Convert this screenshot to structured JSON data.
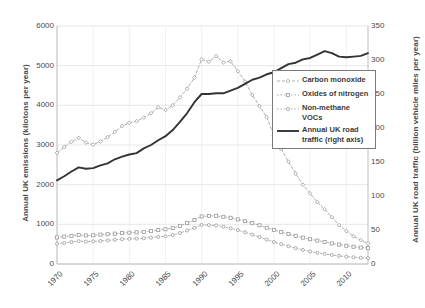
{
  "chart_data": {
    "type": "line",
    "title": "",
    "subtitle": "",
    "xlabel": "",
    "ylabel": "Annual UK emissions (kilotons per year)",
    "ylabel_right": "Annual UK road traffic (billion vehicle miles per year)",
    "grid": true,
    "legend_position": "center-right",
    "xlim": [
      1970,
      2013
    ],
    "ylim": [
      0,
      6000
    ],
    "ylim_right": [
      0,
      350
    ],
    "xticks": [
      "1970",
      "1975",
      "1980",
      "1985",
      "1990",
      "1995",
      "2000",
      "2005",
      "2010"
    ],
    "xtick_values": [
      1970,
      1975,
      1980,
      1985,
      1990,
      1995,
      2000,
      2005,
      2010
    ],
    "yticks_left": [
      "0",
      "1000",
      "2000",
      "3000",
      "4000",
      "5000",
      "6000"
    ],
    "ytick_values_left": [
      0,
      1000,
      2000,
      3000,
      4000,
      5000,
      6000
    ],
    "yticks_right": [
      "0",
      "50",
      "100",
      "150",
      "200",
      "250",
      "300",
      "350"
    ],
    "ytick_values_right": [
      0,
      50,
      100,
      150,
      200,
      250,
      300,
      350
    ],
    "x": [
      1970,
      1971,
      1972,
      1973,
      1974,
      1975,
      1976,
      1977,
      1978,
      1979,
      1980,
      1981,
      1982,
      1983,
      1984,
      1985,
      1986,
      1987,
      1988,
      1989,
      1990,
      1991,
      1992,
      1993,
      1994,
      1995,
      1996,
      1997,
      1998,
      1999,
      2000,
      2001,
      2002,
      2003,
      2004,
      2005,
      2006,
      2007,
      2008,
      2009,
      2010,
      2011,
      2012,
      2013
    ],
    "series": [
      {
        "name": "Carbon monoxide",
        "axis": "left",
        "color": "#9a9a9a",
        "style": "dashed-markers",
        "marker": "diamond",
        "values": [
          2800,
          2950,
          3080,
          3180,
          3060,
          3010,
          3090,
          3200,
          3330,
          3480,
          3560,
          3600,
          3690,
          3800,
          3950,
          3880,
          4000,
          4200,
          4420,
          4700,
          5160,
          5100,
          5240,
          5080,
          5110,
          4860,
          4600,
          4260,
          3980,
          3700,
          3240,
          2900,
          2580,
          2280,
          2000,
          1780,
          1560,
          1380,
          1180,
          980,
          830,
          700,
          600,
          520
        ]
      },
      {
        "name": "Oxides of nitrogen",
        "axis": "left",
        "color": "#9a9a9a",
        "style": "dotted-markers",
        "marker": "square",
        "values": [
          670,
          690,
          710,
          730,
          720,
          725,
          740,
          750,
          765,
          780,
          790,
          800,
          810,
          830,
          855,
          875,
          905,
          960,
          1030,
          1110,
          1200,
          1210,
          1215,
          1190,
          1165,
          1125,
          1080,
          1030,
          975,
          915,
          860,
          805,
          755,
          710,
          665,
          625,
          590,
          555,
          520,
          490,
          460,
          435,
          415,
          400
        ]
      },
      {
        "name": "Non-methane VOCs",
        "axis": "left",
        "color": "#9a9a9a",
        "style": "dotted-markers",
        "marker": "circle",
        "values": [
          510,
          530,
          555,
          575,
          565,
          570,
          580,
          595,
          610,
          625,
          635,
          640,
          650,
          665,
          685,
          700,
          730,
          780,
          845,
          910,
          985,
          980,
          970,
          940,
          900,
          855,
          800,
          740,
          680,
          615,
          555,
          500,
          450,
          400,
          355,
          315,
          282,
          255,
          228,
          205,
          185,
          170,
          158,
          150
        ]
      },
      {
        "name": "Annual UK road traffic (right axis)",
        "axis": "right",
        "color": "#333333",
        "style": "solid",
        "marker": "none",
        "values": [
          123,
          129,
          136,
          142,
          140,
          141,
          145,
          148,
          154,
          158,
          161,
          163,
          170,
          175,
          182,
          188,
          197,
          209,
          222,
          238,
          250,
          250,
          251,
          251,
          255,
          259,
          265,
          271,
          274,
          279,
          282,
          288,
          294,
          296,
          301,
          303,
          308,
          313,
          310,
          305,
          304,
          305,
          306,
          310
        ]
      }
    ]
  }
}
